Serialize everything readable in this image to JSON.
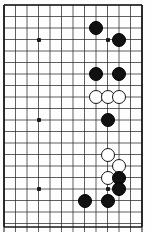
{
  "app": {
    "title": "Go Board Diagram",
    "type": "go-game-board"
  },
  "board": {
    "background_color": "#fefefe",
    "line_color": "#2b2b2b",
    "border_color": "#1a1a1a",
    "black_stone_color": "#111111",
    "white_stone_color": "#ffffff",
    "white_stone_border_color": "#151515",
    "grid_spacing": 11.5,
    "origin_x": 4,
    "origin_y": 5,
    "cols": 12,
    "rows": 19,
    "border_left": 4,
    "border_top": 5,
    "border_right": 142,
    "border_bottom": 227,
    "stone_radius": 7.0,
    "star_points": [
      {
        "col": 3,
        "row": 3
      },
      {
        "col": 9,
        "row": 3
      },
      {
        "col": 3,
        "row": 10
      },
      {
        "col": 3,
        "row": 16
      },
      {
        "col": 9,
        "row": 16
      }
    ],
    "stones": [
      {
        "col": 8,
        "row": 2,
        "color": "black"
      },
      {
        "col": 10,
        "row": 3,
        "color": "black"
      },
      {
        "col": 8,
        "row": 6,
        "color": "black"
      },
      {
        "col": 10,
        "row": 6,
        "color": "black"
      },
      {
        "col": 8,
        "row": 8,
        "color": "white"
      },
      {
        "col": 9,
        "row": 8,
        "color": "white"
      },
      {
        "col": 10,
        "row": 8,
        "color": "white"
      },
      {
        "col": 9,
        "row": 10,
        "color": "black"
      },
      {
        "col": 9,
        "row": 13,
        "color": "white"
      },
      {
        "col": 10,
        "row": 14,
        "color": "white"
      },
      {
        "col": 9,
        "row": 15,
        "color": "white"
      },
      {
        "col": 10,
        "row": 15,
        "color": "black"
      },
      {
        "col": 10,
        "row": 16,
        "color": "black"
      },
      {
        "col": 7,
        "row": 17,
        "color": "black"
      },
      {
        "col": 9,
        "row": 17,
        "color": "black"
      }
    ]
  },
  "counts": {
    "black_stones": "10",
    "white_stones": "5",
    "total_stones": "15"
  }
}
